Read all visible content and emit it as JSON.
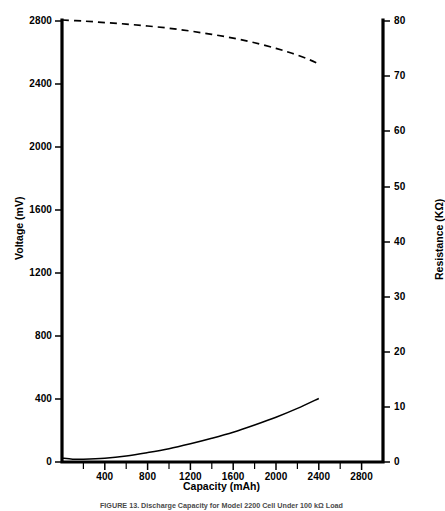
{
  "caption": "FIGURE 13. Discharge Capacity for Model 2200 Cell Under 100 kΩ Load",
  "axis_titles": {
    "left": "Voltage (mV)",
    "right": "Resistance (KΩ)",
    "bottom": "Capacity (mAh)"
  },
  "ticks": {
    "left": [
      "0",
      "400",
      "800",
      "1200",
      "1600",
      "2000",
      "2400",
      "2800"
    ],
    "right": [
      "0",
      "10",
      "20",
      "30",
      "40",
      "50",
      "60",
      "70",
      "80"
    ],
    "bottom": [
      "400",
      "800",
      "1200",
      "1600",
      "2000",
      "2400",
      "2800"
    ]
  },
  "chart_data": {
    "type": "line",
    "title": "",
    "subtitle": "",
    "xlabel": "Capacity (mAh)",
    "ylabel": "Voltage (mV)",
    "y2label": "Resistance (KΩ)",
    "xlim": [
      0,
      3000
    ],
    "ylim": [
      0,
      2800
    ],
    "y2lim": [
      0,
      80
    ],
    "xticks": [
      0,
      400,
      800,
      1200,
      1600,
      2000,
      2400,
      2800
    ],
    "xticks_minor": [
      200,
      600,
      1000,
      1400,
      1800,
      2200,
      2600,
      3000
    ],
    "yticks": [
      0,
      400,
      800,
      1200,
      1600,
      2000,
      2400,
      2800
    ],
    "y2ticks": [
      0,
      10,
      20,
      30,
      40,
      50,
      60,
      70,
      80
    ],
    "grid": false,
    "legend": "none",
    "series": [
      {
        "name": "Voltage",
        "axis": "left",
        "style": "dashed",
        "x": [
          0,
          200,
          400,
          600,
          800,
          1000,
          1200,
          1400,
          1600,
          1800,
          2000,
          2150,
          2300,
          2400
        ],
        "values": [
          2800,
          2793,
          2784,
          2774,
          2762,
          2748,
          2730,
          2709,
          2685,
          2656,
          2620,
          2589,
          2552,
          2522
        ]
      },
      {
        "name": "Resistance",
        "axis": "right",
        "style": "solid",
        "x": [
          0,
          100,
          200,
          400,
          600,
          800,
          1000,
          1200,
          1400,
          1600,
          1800,
          2000,
          2200,
          2400
        ],
        "values": [
          0.7,
          0.5,
          0.5,
          0.7,
          1.1,
          1.7,
          2.4,
          3.3,
          4.3,
          5.4,
          6.7,
          8.1,
          9.7,
          11.5
        ]
      }
    ]
  }
}
